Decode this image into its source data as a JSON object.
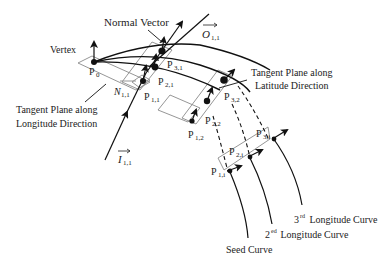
{
  "diagram": {
    "type": "technical-geometry-diagram",
    "labels": {
      "normal_vector": "Normal Vector",
      "vertex": "Vertex",
      "out_vector": "O",
      "out_vector_sub": "1,1",
      "in_vector": "I",
      "in_vector_sub": "1,1",
      "normal_n": "N",
      "normal_n_sub": "1,1",
      "tangent_longitude_line1": "Tangent Plane along",
      "tangent_longitude_line2": "Longitude Direction",
      "tangent_latitude_line1": "Tangent Plane along",
      "tangent_latitude_line2": "Latitude Direction",
      "seed_curve": "Seed Curve",
      "second_curve_num": "2",
      "second_curve_sup": "ed",
      "second_curve_text": " Longitude Curve",
      "third_curve_num": "3",
      "third_curve_sup": "rd",
      "third_curve_text": " Longitude Curve"
    },
    "points": [
      {
        "id": "P0",
        "base": "P",
        "sub": "0"
      },
      {
        "id": "P11",
        "base": "P",
        "sub": "1,1"
      },
      {
        "id": "P21",
        "base": "P",
        "sub": "2,1"
      },
      {
        "id": "P31",
        "base": "P",
        "sub": "3,1"
      },
      {
        "id": "P12",
        "base": "P",
        "sub": "1,2"
      },
      {
        "id": "P22",
        "base": "P",
        "sub": "2,2"
      },
      {
        "id": "P32",
        "base": "P",
        "sub": "3,2"
      },
      {
        "id": "P1i",
        "base": "P",
        "sub": "1,i"
      },
      {
        "id": "P2i",
        "base": "P",
        "sub": "2,i"
      },
      {
        "id": "P3i",
        "base": "P",
        "sub": "3,i"
      }
    ],
    "colors": {
      "ink": "#111111",
      "plane": "#8a8a8a",
      "text": "#222222"
    }
  }
}
